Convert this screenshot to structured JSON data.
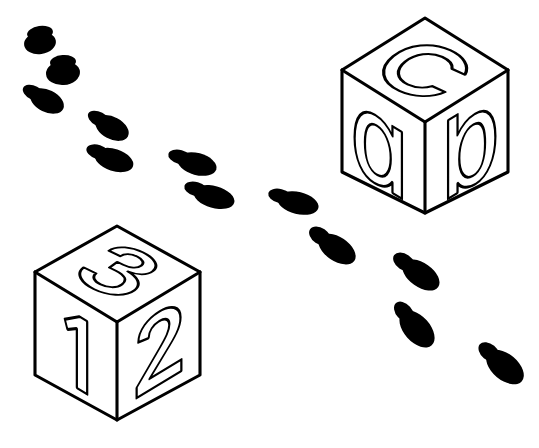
{
  "scene": {
    "title": "Alphabet and number blocks with footprint trail",
    "width": 539,
    "height": 448,
    "background_color": "#ffffff",
    "ink_color": "#000000"
  },
  "blocks": [
    {
      "id": "letter-block",
      "name": "alphabet-block",
      "faces": {
        "top": "c",
        "left": "a",
        "right": "b"
      },
      "position": {
        "top_vertex_x": 425,
        "top_vertex_y": 18
      },
      "geometry": {
        "top": 18,
        "left": 342,
        "right": 508,
        "mid_y": 70,
        "center_y": 122,
        "side_bottom_y": 172,
        "bottom_y": 213
      }
    },
    {
      "id": "number-block",
      "name": "number-block",
      "faces": {
        "top": "3",
        "left": "1",
        "right": "2"
      },
      "position": {
        "top_vertex_x": 117,
        "top_vertex_y": 226
      },
      "geometry": {
        "top": 226,
        "left": 35,
        "right": 200,
        "mid_y": 272,
        "center_y": 322,
        "side_bottom_y": 375,
        "bottom_y": 420
      }
    }
  ],
  "footprints": {
    "count": 12,
    "description": "A trail of shoe prints curving from upper-left down to lower-right between the two blocks",
    "steps": [
      {
        "index": 1,
        "side": "left",
        "heel_x": 40,
        "heel_y": 33,
        "sole_x": 40,
        "sole_y": 43,
        "angle": -8,
        "sole_w": 16,
        "sole_h": 11,
        "heel_w": 13,
        "heel_h": 7
      },
      {
        "index": 2,
        "side": "right",
        "heel_x": 63,
        "heel_y": 62,
        "sole_x": 63,
        "sole_y": 73,
        "angle": -4,
        "sole_w": 17,
        "sole_h": 12,
        "heel_w": 13,
        "heel_h": 7
      },
      {
        "index": 3,
        "side": "left",
        "heel_x": 34,
        "heel_y": 93,
        "sole_x": 47,
        "sole_y": 101,
        "angle": 26,
        "sole_w": 18,
        "sole_h": 11,
        "heel_w": 12,
        "heel_h": 7
      },
      {
        "index": 4,
        "side": "right",
        "heel_x": 99,
        "heel_y": 119,
        "sole_x": 112,
        "sole_y": 128,
        "angle": 28,
        "sole_w": 18,
        "sole_h": 11,
        "heel_w": 12,
        "heel_h": 7
      },
      {
        "index": 5,
        "side": "left",
        "heel_x": 98,
        "heel_y": 152,
        "sole_x": 114,
        "sole_y": 160,
        "angle": 18,
        "sole_w": 20,
        "sole_h": 11,
        "heel_w": 12,
        "heel_h": 7
      },
      {
        "index": 6,
        "side": "right",
        "heel_x": 180,
        "heel_y": 157,
        "sole_x": 197,
        "sole_y": 164,
        "angle": 15,
        "sole_w": 20,
        "sole_h": 11,
        "heel_w": 12,
        "heel_h": 7
      },
      {
        "index": 7,
        "side": "left",
        "heel_x": 196,
        "heel_y": 189,
        "sole_x": 214,
        "sole_y": 197,
        "angle": 16,
        "sole_w": 21,
        "sole_h": 11,
        "heel_w": 12,
        "heel_h": 7
      },
      {
        "index": 8,
        "side": "right",
        "heel_x": 280,
        "heel_y": 196,
        "sole_x": 298,
        "sole_y": 203,
        "angle": 14,
        "sole_w": 21,
        "sole_h": 11,
        "heel_w": 12,
        "heel_h": 7
      },
      {
        "index": 9,
        "side": "left",
        "heel_x": 320,
        "heel_y": 236,
        "sole_x": 337,
        "sole_y": 249,
        "angle": 34,
        "sole_w": 21,
        "sole_h": 12,
        "heel_w": 12,
        "heel_h": 8
      },
      {
        "index": 10,
        "side": "right",
        "heel_x": 404,
        "heel_y": 262,
        "sole_x": 421,
        "sole_y": 275,
        "angle": 35,
        "sole_w": 21,
        "sole_h": 12,
        "heel_w": 12,
        "heel_h": 8
      },
      {
        "index": 11,
        "side": "left",
        "heel_x": 404,
        "heel_y": 312,
        "sole_x": 417,
        "sole_y": 329,
        "angle": 48,
        "sole_w": 22,
        "sole_h": 13,
        "heel_w": 12,
        "heel_h": 8
      },
      {
        "index": 12,
        "side": "right",
        "heel_x": 489,
        "heel_y": 352,
        "sole_x": 505,
        "sole_y": 367,
        "angle": 40,
        "sole_w": 22,
        "sole_h": 13,
        "heel_w": 12,
        "heel_h": 8
      }
    ]
  }
}
